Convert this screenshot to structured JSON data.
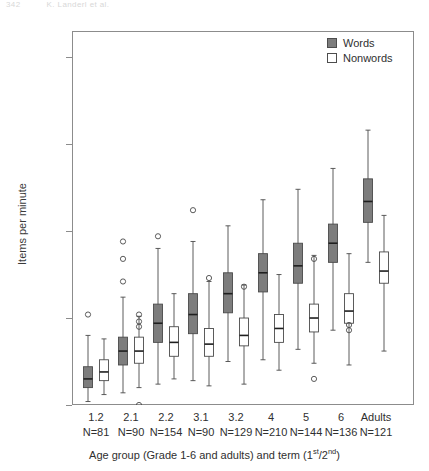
{
  "page_header": {
    "left_text": "342",
    "right_text": "K. Landerl et al."
  },
  "legend": {
    "position": "top-right",
    "items": [
      {
        "label": "Words",
        "style": "filled",
        "color": "#7d7d7d"
      },
      {
        "label": "Nonwords",
        "style": "open",
        "color": "#ffffff"
      }
    ]
  },
  "chart_data": {
    "type": "box",
    "title": "",
    "xlabel_html": "Age group (Grade 1-6 and adults) and term (1<sup>st</sup>/2<sup>nd</sup>)",
    "xlabel": "Age group (Grade 1-6 and adults) and term (1st/2nd)",
    "ylabel": "Items per minute",
    "ylim": [
      0,
      215
    ],
    "yticks": [
      0,
      50,
      100,
      150,
      200
    ],
    "ytick_labels": [
      "0",
      "50",
      "100",
      "150",
      "200"
    ],
    "grid": false,
    "legend_position": "top-right",
    "categories": [
      "1.2",
      "2.1",
      "2.2",
      "3.1",
      "3.2",
      "4",
      "5",
      "6",
      "Adults"
    ],
    "group_n_labels": [
      "N=81",
      "N=90",
      "N=154",
      "N=90",
      "N=129",
      "N=210",
      "N=144",
      "N=136",
      "N=121"
    ],
    "group_n_values": [
      81,
      90,
      154,
      90,
      129,
      210,
      144,
      136,
      121
    ],
    "series": [
      {
        "name": "Words",
        "fill": "#7d7d7d",
        "boxes": [
          {
            "category": "1.2",
            "whisker_low": 2,
            "q1": 10,
            "median": 15,
            "q3": 22,
            "whisker_high": 40,
            "outliers": [
              52
            ]
          },
          {
            "category": "2.1",
            "whisker_low": 7,
            "q1": 23,
            "median": 31,
            "q3": 39,
            "whisker_high": 62,
            "outliers": [
              71,
              84,
              94
            ]
          },
          {
            "category": "2.2",
            "whisker_low": 12,
            "q1": 36,
            "median": 47,
            "q3": 58,
            "whisker_high": 90,
            "outliers": [
              97
            ]
          },
          {
            "category": "3.1",
            "whisker_low": 14,
            "q1": 41,
            "median": 52,
            "q3": 64,
            "whisker_high": 94,
            "outliers": [
              112
            ]
          },
          {
            "category": "3.2",
            "whisker_low": 25,
            "q1": 53,
            "median": 64,
            "q3": 76,
            "whisker_high": 103,
            "outliers": []
          },
          {
            "category": "4",
            "whisker_low": 26,
            "q1": 65,
            "median": 76,
            "q3": 87,
            "whisker_high": 118,
            "outliers": []
          },
          {
            "category": "5",
            "whisker_low": 32,
            "q1": 70,
            "median": 80,
            "q3": 93,
            "whisker_high": 124,
            "outliers": []
          },
          {
            "category": "6",
            "whisker_low": 43,
            "q1": 82,
            "median": 93,
            "q3": 104,
            "whisker_high": 136,
            "outliers": []
          },
          {
            "category": "Adults",
            "whisker_low": 82,
            "q1": 105,
            "median": 117,
            "q3": 130,
            "whisker_high": 158,
            "outliers": []
          }
        ]
      },
      {
        "name": "Nonwords",
        "fill": "#ffffff",
        "boxes": [
          {
            "category": "1.2",
            "whisker_low": 6,
            "q1": 14,
            "median": 19,
            "q3": 26,
            "whisker_high": 38,
            "outliers": []
          },
          {
            "category": "2.1",
            "whisker_low": 10,
            "q1": 24,
            "median": 31,
            "q3": 39,
            "whisker_high": 51,
            "outliers": [
              0,
              45,
              48,
              52
            ]
          },
          {
            "category": "2.2",
            "whisker_low": 15,
            "q1": 28,
            "median": 36,
            "q3": 45,
            "whisker_high": 64,
            "outliers": []
          },
          {
            "category": "3.1",
            "whisker_low": 11,
            "q1": 28,
            "median": 35,
            "q3": 44,
            "whisker_high": 71,
            "outliers": [
              73
            ]
          },
          {
            "category": "3.2",
            "whisker_low": 12,
            "q1": 34,
            "median": 40,
            "q3": 50,
            "whisker_high": 69,
            "outliers": [
              68
            ]
          },
          {
            "category": "4",
            "whisker_low": 20,
            "q1": 36,
            "median": 44,
            "q3": 52,
            "whisker_high": 75,
            "outliers": []
          },
          {
            "category": "5",
            "whisker_low": 24,
            "q1": 42,
            "median": 50,
            "q3": 58,
            "whisker_high": 86,
            "outliers": [
              15,
              84
            ]
          },
          {
            "category": "6",
            "whisker_low": 23,
            "q1": 47,
            "median": 54,
            "q3": 64,
            "whisker_high": 87,
            "outliers": [
              43,
              46
            ]
          },
          {
            "category": "Adults",
            "whisker_low": 31,
            "q1": 70,
            "median": 77,
            "q3": 88,
            "whisker_high": 109,
            "outliers": []
          }
        ]
      }
    ]
  },
  "axes_geometry": {
    "plot_left": 72,
    "plot_top": 31,
    "plot_width": 342,
    "plot_height": 374,
    "y_min": 0,
    "y_max": 215,
    "group_centers": [
      96,
      131,
      166,
      201,
      236,
      271,
      306,
      341,
      376
    ],
    "series_offset": 8,
    "box_width": 9
  }
}
